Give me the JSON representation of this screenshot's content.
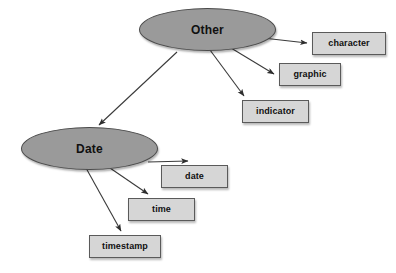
{
  "diagram": {
    "type": "hierarchy-tree",
    "background_color": "#ffffff",
    "ellipse_fill": "#9a9a9a",
    "ellipse_stroke": "#4a4a4a",
    "box_fill": "#d6d6d6",
    "box_stroke": "#5a5a5a",
    "edge_color": "#3a3a3a",
    "nodes": {
      "other": {
        "label": "Other",
        "shape": "ellipse"
      },
      "date_group": {
        "label": "Date",
        "shape": "ellipse"
      },
      "character": {
        "label": "character",
        "shape": "rectangle"
      },
      "graphic": {
        "label": "graphic",
        "shape": "rectangle"
      },
      "indicator": {
        "label": "indicator",
        "shape": "rectangle"
      },
      "date": {
        "label": "date",
        "shape": "rectangle"
      },
      "time": {
        "label": "time",
        "shape": "rectangle"
      },
      "timestamp": {
        "label": "timestamp",
        "shape": "rectangle"
      }
    },
    "edges": [
      {
        "from": "Other",
        "to": "character"
      },
      {
        "from": "Other",
        "to": "graphic"
      },
      {
        "from": "Other",
        "to": "indicator"
      },
      {
        "from": "Other",
        "to": "Date"
      },
      {
        "from": "Date",
        "to": "date"
      },
      {
        "from": "Date",
        "to": "time"
      },
      {
        "from": "Date",
        "to": "timestamp"
      }
    ]
  }
}
